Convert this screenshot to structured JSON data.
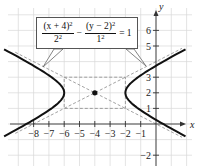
{
  "chart_data": {
    "type": "line",
    "title": "",
    "equation": "(x + 4)^2 / 2^2 - (y - 2)^2 / 1^2 = 1",
    "xlabel": "x",
    "ylabel": "y",
    "xlim": [
      -9,
      1.5
    ],
    "ylim": [
      -2.5,
      7
    ],
    "grid": true,
    "x_ticks": [
      -8,
      -7,
      -6,
      -5,
      -4,
      -3,
      -2,
      -1
    ],
    "y_ticks": [
      -2,
      1,
      2,
      3,
      5,
      6
    ],
    "center": {
      "x": -4,
      "y": 2
    },
    "vertices": [
      {
        "x": -6,
        "y": 2
      },
      {
        "x": -2,
        "y": 2
      }
    ],
    "a": 2,
    "b": 1,
    "asymptotes": [
      "y - 2 = (1/2)(x + 4)",
      "y - 2 = -(1/2)(x + 4)"
    ],
    "fundamental_rectangle": {
      "x": [
        -6,
        -2
      ],
      "y": [
        1,
        3
      ]
    },
    "series": [
      {
        "name": "hyperbola",
        "style": "solid",
        "color": "#111111"
      },
      {
        "name": "asymptotes",
        "style": "dashed",
        "color": "#888888"
      },
      {
        "name": "rectangle",
        "style": "dashed",
        "color": "#888888"
      },
      {
        "name": "center-point",
        "style": "dot",
        "color": "#111111"
      }
    ]
  },
  "equation_box": {
    "num1": "(x + 4)",
    "num1_exp": "2",
    "den1": "2",
    "den1_exp": "2",
    "minus": "−",
    "num2": "(y − 2)",
    "num2_exp": "2",
    "den2": "1",
    "den2_exp": "2",
    "equals": "= 1"
  },
  "axes": {
    "x_name": "x",
    "y_name": "y",
    "x_tick_labels": [
      "−8",
      "−7",
      "−6",
      "−5",
      "−4",
      "−3",
      "−2",
      "−1"
    ],
    "y_tick_labels": [
      "6",
      "5",
      "3",
      "2",
      "1",
      "−2"
    ]
  }
}
